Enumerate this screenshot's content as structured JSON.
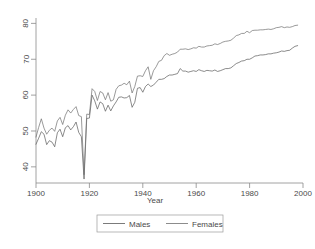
{
  "chart_data": {
    "type": "line",
    "title": "",
    "xlabel": "Year",
    "ylabel": "",
    "xlim": [
      1900,
      2000
    ],
    "ylim": [
      35.5,
      81.5
    ],
    "xticks": [
      1900,
      1920,
      1940,
      1960,
      1980,
      2000
    ],
    "yticks": [
      40,
      50,
      60,
      70,
      80
    ],
    "grid": false,
    "legend_position": "bottom-center",
    "x": [
      1900,
      1901,
      1902,
      1903,
      1904,
      1905,
      1906,
      1907,
      1908,
      1909,
      1910,
      1911,
      1912,
      1913,
      1914,
      1915,
      1916,
      1917,
      1918,
      1919,
      1920,
      1921,
      1922,
      1923,
      1924,
      1925,
      1926,
      1927,
      1928,
      1929,
      1930,
      1931,
      1932,
      1933,
      1934,
      1935,
      1936,
      1937,
      1938,
      1939,
      1940,
      1941,
      1942,
      1943,
      1944,
      1945,
      1946,
      1947,
      1948,
      1949,
      1950,
      1951,
      1952,
      1953,
      1954,
      1955,
      1956,
      1957,
      1958,
      1959,
      1960,
      1961,
      1962,
      1963,
      1964,
      1965,
      1966,
      1967,
      1968,
      1969,
      1970,
      1971,
      1972,
      1973,
      1974,
      1975,
      1976,
      1977,
      1978,
      1979,
      1980,
      1981,
      1982,
      1983,
      1984,
      1985,
      1986,
      1987,
      1988,
      1989,
      1990,
      1991,
      1992,
      1993,
      1994,
      1995,
      1996,
      1997,
      1998
    ],
    "series": [
      {
        "name": "Males",
        "values": [
          46.3,
          48.0,
          49.8,
          49.1,
          46.2,
          47.3,
          46.9,
          45.6,
          49.5,
          50.5,
          48.4,
          50.9,
          51.5,
          50.3,
          51.2,
          52.5,
          49.6,
          48.4,
          36.6,
          53.5,
          53.6,
          60.0,
          58.4,
          56.1,
          58.1,
          57.6,
          55.5,
          57.2,
          55.6,
          57.0,
          58.1,
          59.4,
          59.5,
          59.2,
          59.3,
          59.9,
          56.6,
          58.0,
          61.9,
          62.1,
          60.8,
          62.4,
          63.1,
          62.4,
          62.8,
          63.6,
          64.4,
          64.4,
          64.6,
          65.2,
          65.6,
          65.6,
          65.8,
          66.0,
          67.4,
          66.7,
          66.7,
          66.4,
          66.6,
          66.8,
          66.6,
          67.1,
          66.8,
          66.6,
          66.9,
          66.8,
          66.7,
          67.0,
          66.6,
          66.8,
          67.1,
          67.4,
          67.4,
          67.6,
          68.2,
          68.8,
          69.1,
          69.5,
          69.6,
          70.0,
          70.0,
          70.4,
          70.9,
          71.0,
          71.2,
          71.2,
          71.3,
          71.5,
          71.5,
          71.7,
          71.8,
          72.0,
          72.3,
          72.2,
          72.4,
          72.5,
          73.1,
          73.6,
          73.8
        ]
      },
      {
        "name": "Females",
        "values": [
          48.3,
          51.0,
          53.4,
          50.8,
          49.1,
          50.2,
          50.8,
          49.9,
          52.8,
          53.8,
          51.8,
          54.4,
          55.9,
          55.0,
          56.0,
          56.8,
          54.3,
          54.0,
          37.8,
          54.7,
          54.6,
          61.8,
          61.0,
          58.5,
          61.0,
          60.6,
          58.7,
          60.7,
          58.3,
          58.7,
          61.6,
          62.6,
          62.8,
          63.3,
          62.9,
          63.9,
          60.6,
          62.4,
          65.3,
          65.4,
          65.2,
          66.8,
          67.9,
          64.4,
          66.8,
          67.9,
          69.4,
          69.7,
          71.0,
          71.6,
          71.1,
          71.4,
          71.6,
          72.0,
          72.8,
          72.8,
          72.9,
          72.7,
          72.9,
          73.2,
          73.1,
          73.6,
          73.4,
          73.4,
          73.7,
          73.8,
          73.9,
          74.3,
          74.1,
          74.4,
          74.8,
          75.0,
          75.1,
          75.3,
          75.9,
          76.6,
          76.8,
          77.2,
          77.2,
          77.8,
          77.4,
          78.0,
          78.1,
          78.1,
          78.2,
          78.2,
          78.3,
          78.4,
          78.3,
          78.5,
          78.8,
          78.9,
          79.1,
          78.8,
          79.0,
          78.9,
          79.1,
          79.4,
          79.5
        ]
      }
    ],
    "series_colors": [
      "#595959",
      "#6e6e6e"
    ]
  },
  "axis": {
    "x_tick_labels": [
      "1900",
      "1920",
      "1940",
      "1960",
      "1980",
      "2000"
    ],
    "y_tick_labels": [
      "40",
      "50",
      "60",
      "70",
      "80"
    ],
    "x_title": "Year"
  },
  "legend": {
    "items": [
      {
        "label": "Males"
      },
      {
        "label": "Females"
      }
    ]
  }
}
